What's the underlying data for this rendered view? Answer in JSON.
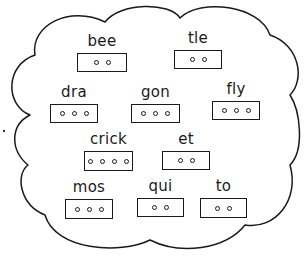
{
  "worksheet": {
    "shape": "cloud",
    "stroke_color": "#1a1a1a",
    "background_color": "#ffffff",
    "tiles": [
      {
        "syllable": "bee",
        "dots": 2,
        "x": 77,
        "y": 33,
        "w": 50,
        "h": 19
      },
      {
        "syllable": "tle",
        "dots": 2,
        "x": 174,
        "y": 30,
        "w": 48,
        "h": 19
      },
      {
        "syllable": "dra",
        "dots": 3,
        "x": 50,
        "y": 84,
        "w": 48,
        "h": 19
      },
      {
        "syllable": "gon",
        "dots": 3,
        "x": 131,
        "y": 84,
        "w": 49,
        "h": 19
      },
      {
        "syllable": "fly",
        "dots": 3,
        "x": 212,
        "y": 81,
        "w": 48,
        "h": 19
      },
      {
        "syllable": "crick",
        "dots": 4,
        "x": 84,
        "y": 131,
        "w": 49,
        "h": 20
      },
      {
        "syllable": "et",
        "dots": 2,
        "x": 162,
        "y": 131,
        "w": 48,
        "h": 19
      },
      {
        "syllable": "mos",
        "dots": 3,
        "x": 65,
        "y": 179,
        "w": 48,
        "h": 20
      },
      {
        "syllable": "qui",
        "dots": 2,
        "x": 137,
        "y": 178,
        "w": 47,
        "h": 19
      },
      {
        "syllable": "to",
        "dots": 2,
        "x": 200,
        "y": 178,
        "w": 47,
        "h": 20
      }
    ]
  }
}
